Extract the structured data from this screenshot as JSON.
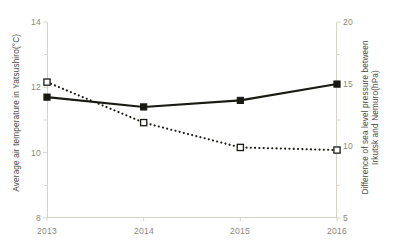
{
  "chart_data": {
    "type": "line",
    "title": "",
    "xlabel": "",
    "categories": [
      "2013",
      "2014",
      "2015",
      "2016"
    ],
    "x": [
      2013,
      2014,
      2015,
      2016
    ],
    "grid": false,
    "legend": "none",
    "axes": {
      "x": {
        "tick_labels": [
          "2013",
          "2014",
          "2015",
          "2016"
        ],
        "range": [
          2013,
          2016
        ]
      },
      "y_left": {
        "label": "Average air temperature in Yatsushiro(°C)",
        "tick_labels": [
          "14",
          "12",
          "10",
          "8"
        ],
        "ticks": [
          14,
          12,
          10,
          8
        ],
        "ylim": [
          8,
          14
        ]
      },
      "y_right": {
        "label": "Difference of sea level pressure between Irkutsk and Nemuro(hPa)",
        "tick_labels": [
          "20",
          "15",
          "10",
          "5"
        ],
        "ticks": [
          20,
          15,
          10,
          5
        ],
        "ylim": [
          5,
          20
        ]
      }
    },
    "series": [
      {
        "name": "Average air temperature in Yatsushiro(°C)",
        "axis": "y_left",
        "style": "solid",
        "marker": "filled-square",
        "color": "#1a1a14",
        "values": [
          11.7,
          11.4,
          11.6,
          12.1
        ]
      },
      {
        "name": "Difference of sea level pressure between Irkutsk and Nemuro(hPa)",
        "axis": "y_right",
        "style": "dotted",
        "marker": "open-square",
        "color": "#1a1a14",
        "values": [
          15.4,
          12.3,
          10.4,
          10.2
        ]
      }
    ]
  },
  "ticks": {
    "left": [
      {
        "text": "14"
      },
      {
        "text": "12"
      },
      {
        "text": "10"
      },
      {
        "text": "8"
      }
    ],
    "right": [
      {
        "text": "20"
      },
      {
        "text": "15"
      },
      {
        "text": "10"
      },
      {
        "text": "5"
      }
    ],
    "x": [
      {
        "text": "2013"
      },
      {
        "text": "2014"
      },
      {
        "text": "2015"
      },
      {
        "text": "2016"
      }
    ]
  },
  "labels": {
    "y_left": "Average air temperature in Yatsushiro(°C)",
    "y_right": "Difference of sea level pressure between\nIrkutsk and Nemuro(hPa)"
  },
  "colors": {
    "axis": "#d6d3c6",
    "tick_text": "#8a887c",
    "axis_title_text": "#4a4a42",
    "series_solid": "#1a1a14",
    "series_dotted": "#1a1a14",
    "background": "#ffffff"
  }
}
